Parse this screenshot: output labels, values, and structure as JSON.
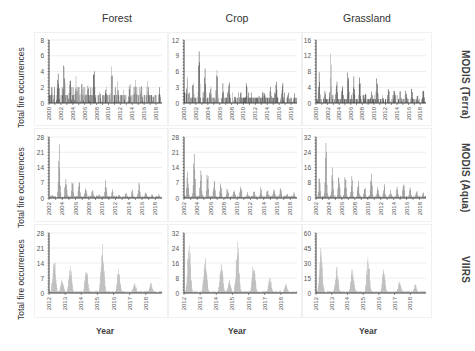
{
  "columns": [
    "Forest",
    "Crop",
    "Grassland"
  ],
  "rows": [
    "MODIS (Terra)",
    "MODIS (Aqua)",
    "VIIRS"
  ],
  "ylabel": "Total fire occurrences",
  "xlabel": "Year",
  "colors": {
    "terra_bar_dark": "#3a3a3a",
    "terra_bar_light": "#9a9a9a",
    "aqua_bar": "#7a7a7a",
    "viirs_bar": "#b8b8b8",
    "axis": "#404040",
    "grid": "#eeeeee"
  },
  "chart_data": [
    {
      "type": "bar",
      "row": "MODIS (Terra)",
      "column": "Forest",
      "ylim": [
        0,
        8
      ],
      "yticks": [
        0,
        2,
        4,
        6,
        8
      ],
      "xticks": [
        "2000",
        "2002",
        "2004",
        "2006",
        "2008",
        "2010",
        "2012",
        "2014",
        "2016",
        "2018"
      ],
      "peaks": [
        {
          "x": "2000",
          "y": 2
        },
        {
          "x": "2001",
          "y": 5
        },
        {
          "x": "2002",
          "y": 7
        },
        {
          "x": "2003",
          "y": 5
        },
        {
          "x": "2004",
          "y": 4
        },
        {
          "x": "2005",
          "y": 4
        },
        {
          "x": "2006",
          "y": 3
        },
        {
          "x": "2007",
          "y": 6
        },
        {
          "x": "2008",
          "y": 2
        },
        {
          "x": "2009",
          "y": 3
        },
        {
          "x": "2010",
          "y": 5
        },
        {
          "x": "2011",
          "y": 3
        },
        {
          "x": "2012",
          "y": 2
        },
        {
          "x": "2013",
          "y": 3
        },
        {
          "x": "2014",
          "y": 4
        },
        {
          "x": "2015",
          "y": 3
        },
        {
          "x": "2016",
          "y": 3
        },
        {
          "x": "2017",
          "y": 1
        },
        {
          "x": "2018",
          "y": 2
        }
      ]
    },
    {
      "type": "bar",
      "row": "MODIS (Terra)",
      "column": "Crop",
      "ylim": [
        0,
        12
      ],
      "yticks": [
        0,
        3,
        6,
        9,
        12
      ],
      "xticks": [
        "2000",
        "2002",
        "2004",
        "2006",
        "2008",
        "2010",
        "2012",
        "2014",
        "2016",
        "2018"
      ],
      "peaks": [
        {
          "x": "2000",
          "y": 6
        },
        {
          "x": "2001",
          "y": 5
        },
        {
          "x": "2002",
          "y": 10
        },
        {
          "x": "2003",
          "y": 8
        },
        {
          "x": "2004",
          "y": 4
        },
        {
          "x": "2005",
          "y": 7
        },
        {
          "x": "2006",
          "y": 4
        },
        {
          "x": "2007",
          "y": 5
        },
        {
          "x": "2008",
          "y": 2
        },
        {
          "x": "2009",
          "y": 3
        },
        {
          "x": "2010",
          "y": 5
        },
        {
          "x": "2011",
          "y": 1
        },
        {
          "x": "2012",
          "y": 2
        },
        {
          "x": "2013",
          "y": 2
        },
        {
          "x": "2014",
          "y": 4
        },
        {
          "x": "2015",
          "y": 5
        },
        {
          "x": "2016",
          "y": 5
        },
        {
          "x": "2017",
          "y": 3
        },
        {
          "x": "2018",
          "y": 2
        }
      ]
    },
    {
      "type": "bar",
      "row": "MODIS (Terra)",
      "column": "Grassland",
      "ylim": [
        0,
        16
      ],
      "yticks": [
        0,
        4,
        8,
        12,
        16
      ],
      "xticks": [
        "2000",
        "2002",
        "2004",
        "2006",
        "2008",
        "2010",
        "2012",
        "2014",
        "2016",
        "2018"
      ],
      "peaks": [
        {
          "x": "2000",
          "y": 9
        },
        {
          "x": "2001",
          "y": 4
        },
        {
          "x": "2002",
          "y": 13
        },
        {
          "x": "2003",
          "y": 8
        },
        {
          "x": "2004",
          "y": 6
        },
        {
          "x": "2005",
          "y": 10
        },
        {
          "x": "2006",
          "y": 7
        },
        {
          "x": "2007",
          "y": 7
        },
        {
          "x": "2008",
          "y": 3
        },
        {
          "x": "2009",
          "y": 3
        },
        {
          "x": "2010",
          "y": 8
        },
        {
          "x": "2011",
          "y": 2
        },
        {
          "x": "2012",
          "y": 5
        },
        {
          "x": "2013",
          "y": 4
        },
        {
          "x": "2014",
          "y": 4
        },
        {
          "x": "2015",
          "y": 4
        },
        {
          "x": "2016",
          "y": 5
        },
        {
          "x": "2017",
          "y": 3
        },
        {
          "x": "2018",
          "y": 4
        }
      ]
    },
    {
      "type": "bar",
      "row": "MODIS (Aqua)",
      "column": "Forest",
      "ylim": [
        0,
        28
      ],
      "yticks": [
        0,
        7,
        14,
        21,
        28
      ],
      "xticks": [
        "2002",
        "2004",
        "2006",
        "2008",
        "2010",
        "2012",
        "2014",
        "2016",
        "2018"
      ],
      "peaks": [
        {
          "x": "2002",
          "y": 2
        },
        {
          "x": "2003",
          "y": 25
        },
        {
          "x": "2004",
          "y": 14
        },
        {
          "x": "2005",
          "y": 10
        },
        {
          "x": "2006",
          "y": 10
        },
        {
          "x": "2007",
          "y": 6
        },
        {
          "x": "2008",
          "y": 4
        },
        {
          "x": "2009",
          "y": 2
        },
        {
          "x": "2010",
          "y": 9
        },
        {
          "x": "2011",
          "y": 4
        },
        {
          "x": "2012",
          "y": 2
        },
        {
          "x": "2013",
          "y": 3
        },
        {
          "x": "2014",
          "y": 4
        },
        {
          "x": "2015",
          "y": 8
        },
        {
          "x": "2016",
          "y": 4
        },
        {
          "x": "2017",
          "y": 2
        },
        {
          "x": "2018",
          "y": 2
        }
      ]
    },
    {
      "type": "bar",
      "row": "MODIS (Aqua)",
      "column": "Crop",
      "ylim": [
        0,
        28
      ],
      "yticks": [
        0,
        7,
        14,
        21,
        28
      ],
      "xticks": [
        "2002",
        "2004",
        "2006",
        "2008",
        "2010",
        "2012",
        "2014",
        "2016",
        "2018"
      ],
      "peaks": [
        {
          "x": "2002",
          "y": 13
        },
        {
          "x": "2003",
          "y": 24
        },
        {
          "x": "2004",
          "y": 15
        },
        {
          "x": "2005",
          "y": 14
        },
        {
          "x": "2006",
          "y": 10
        },
        {
          "x": "2007",
          "y": 9
        },
        {
          "x": "2008",
          "y": 6
        },
        {
          "x": "2009",
          "y": 6
        },
        {
          "x": "2010",
          "y": 8
        },
        {
          "x": "2011",
          "y": 3
        },
        {
          "x": "2012",
          "y": 4
        },
        {
          "x": "2013",
          "y": 5
        },
        {
          "x": "2014",
          "y": 5
        },
        {
          "x": "2015",
          "y": 6
        },
        {
          "x": "2016",
          "y": 6
        },
        {
          "x": "2017",
          "y": 3
        },
        {
          "x": "2018",
          "y": 3
        }
      ]
    },
    {
      "type": "bar",
      "row": "MODIS (Aqua)",
      "column": "Grassland",
      "ylim": [
        0,
        32
      ],
      "yticks": [
        0,
        8,
        16,
        24,
        32
      ],
      "xticks": [
        "2002",
        "2004",
        "2006",
        "2008",
        "2010",
        "2012",
        "2014",
        "2016",
        "2018"
      ],
      "peaks": [
        {
          "x": "2002",
          "y": 13
        },
        {
          "x": "2003",
          "y": 31
        },
        {
          "x": "2004",
          "y": 16
        },
        {
          "x": "2005",
          "y": 15
        },
        {
          "x": "2006",
          "y": 15
        },
        {
          "x": "2007",
          "y": 12
        },
        {
          "x": "2008",
          "y": 10
        },
        {
          "x": "2009",
          "y": 7
        },
        {
          "x": "2010",
          "y": 17
        },
        {
          "x": "2011",
          "y": 6
        },
        {
          "x": "2012",
          "y": 8
        },
        {
          "x": "2013",
          "y": 5
        },
        {
          "x": "2014",
          "y": 7
        },
        {
          "x": "2015",
          "y": 11
        },
        {
          "x": "2016",
          "y": 7
        },
        {
          "x": "2017",
          "y": 5
        },
        {
          "x": "2018",
          "y": 4
        }
      ]
    },
    {
      "type": "bar",
      "row": "VIIRS",
      "column": "Forest",
      "ylim": [
        0,
        28
      ],
      "yticks": [
        0,
        7,
        14,
        21,
        28
      ],
      "xticks": [
        "2012",
        "2013",
        "2014",
        "2015",
        "2016",
        "2017",
        "2018"
      ],
      "peaks": [
        {
          "x": "2012",
          "y": 19
        },
        {
          "x": "2012.5",
          "y": 7
        },
        {
          "x": "2013",
          "y": 14
        },
        {
          "x": "2014",
          "y": 13
        },
        {
          "x": "2015",
          "y": 25
        },
        {
          "x": "2016",
          "y": 12
        },
        {
          "x": "2017",
          "y": 5
        },
        {
          "x": "2018",
          "y": 5
        }
      ]
    },
    {
      "type": "bar",
      "row": "VIIRS",
      "column": "Crop",
      "ylim": [
        0,
        32
      ],
      "yticks": [
        0,
        8,
        16,
        24,
        32
      ],
      "xticks": [
        "2012",
        "2013",
        "2014",
        "2015",
        "2016",
        "2017",
        "2018"
      ],
      "peaks": [
        {
          "x": "2012",
          "y": 30
        },
        {
          "x": "2013",
          "y": 20
        },
        {
          "x": "2014",
          "y": 19
        },
        {
          "x": "2014.5",
          "y": 7
        },
        {
          "x": "2015",
          "y": 29
        },
        {
          "x": "2016",
          "y": 19
        },
        {
          "x": "2017",
          "y": 9
        },
        {
          "x": "2018",
          "y": 5
        }
      ]
    },
    {
      "type": "bar",
      "row": "VIIRS",
      "column": "Grassland",
      "ylim": [
        0,
        60
      ],
      "yticks": [
        0,
        15,
        30,
        45,
        60
      ],
      "xticks": [
        "2012",
        "2013",
        "2014",
        "2015",
        "2016",
        "2017",
        "2018"
      ],
      "peaks": [
        {
          "x": "2012",
          "y": 48
        },
        {
          "x": "2013",
          "y": 28
        },
        {
          "x": "2014",
          "y": 27
        },
        {
          "x": "2015",
          "y": 38
        },
        {
          "x": "2016",
          "y": 25
        },
        {
          "x": "2017",
          "y": 12
        },
        {
          "x": "2018",
          "y": 9
        }
      ]
    }
  ]
}
